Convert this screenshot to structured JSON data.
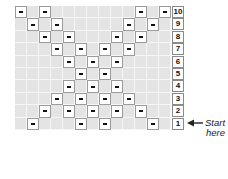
{
  "chart": {
    "columns": 13,
    "rows": [
      {
        "label": "10",
        "purl_cols": [
          1,
          3,
          11,
          13
        ]
      },
      {
        "label": "9",
        "purl_cols": [
          2,
          4,
          10,
          12
        ]
      },
      {
        "label": "8",
        "purl_cols": [
          3,
          5,
          9,
          11
        ]
      },
      {
        "label": "7",
        "purl_cols": [
          4,
          6,
          8,
          10
        ]
      },
      {
        "label": "6",
        "purl_cols": [
          5,
          7,
          9
        ]
      },
      {
        "label": "5",
        "purl_cols": [
          6,
          8
        ]
      },
      {
        "label": "4",
        "purl_cols": [
          5,
          7,
          9
        ]
      },
      {
        "label": "3",
        "purl_cols": [
          4,
          6,
          8,
          10
        ]
      },
      {
        "label": "2",
        "purl_cols": [
          3,
          5,
          7,
          9,
          11
        ]
      },
      {
        "label": "1",
        "purl_cols": [
          2,
          6,
          8,
          12
        ]
      }
    ],
    "symbol": "dash",
    "colors": {
      "knit_cell": "#e4e4e4",
      "purl_cell": "#ffffff",
      "dash": "#111111",
      "grid_line": "#f6f6f6"
    }
  },
  "annotation": {
    "line1": "Start",
    "line2": "here",
    "arrow_icon": "left-arrow-icon",
    "points_to_row": "1"
  }
}
